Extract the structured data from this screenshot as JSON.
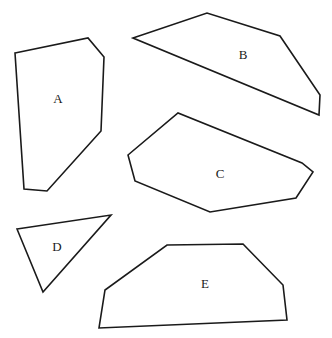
{
  "figure": {
    "width": 332,
    "height": 338,
    "background_color": "#ffffff",
    "stroke_color": "#1a1a1a",
    "label_color": "#1a1a1a",
    "stroke_width": 1.6,
    "label_font_size": 13
  },
  "shapes": [
    {
      "id": "shape-a",
      "label": "A",
      "label_x": 58,
      "label_y": 100,
      "vertex_count": 6,
      "points": "15,53 88,38 104,57 101,131 47,191 24,189",
      "description": "hexagon"
    },
    {
      "id": "shape-b",
      "label": "B",
      "label_x": 243,
      "label_y": 56,
      "vertex_count": 5,
      "points": "133,38 207,13 280,36 320,95 319,115",
      "description": "pentagon"
    },
    {
      "id": "shape-c",
      "label": "C",
      "label_x": 220,
      "label_y": 175,
      "vertex_count": 7,
      "points": "128,155 178,113 302,163 313,172 296,198 210,212 135,181",
      "description": "heptagon"
    },
    {
      "id": "shape-d",
      "label": "D",
      "label_x": 57,
      "label_y": 248,
      "vertex_count": 3,
      "points": "17,229 111,215 43,292",
      "description": "triangle"
    },
    {
      "id": "shape-e",
      "label": "E",
      "label_x": 205,
      "label_y": 285,
      "vertex_count": 6,
      "points": "167,245 243,244 283,285 287,320 99,328 105,290",
      "description": "hexagon"
    }
  ]
}
